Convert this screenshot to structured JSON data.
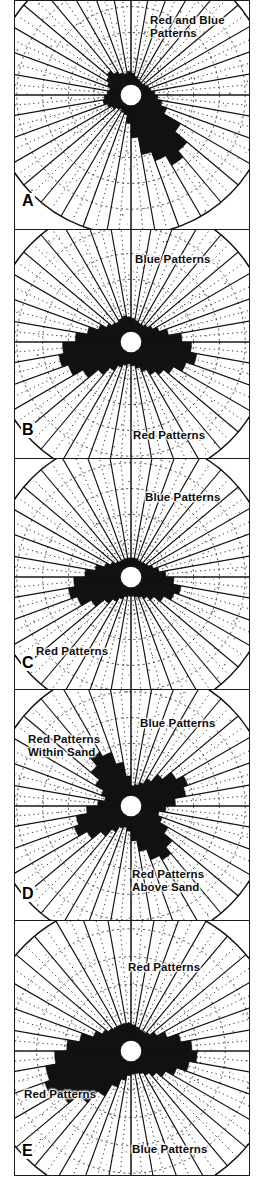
{
  "figure": {
    "kind": "rose-diagram-figure",
    "panel_count": 5,
    "ink_color": "#111111",
    "fill_color": "#111111",
    "background_color": "#ffffff"
  },
  "chart_data": [
    {
      "type": "rose",
      "panel": "A",
      "title": "Red and Blue\nPatterns",
      "labels": [
        {
          "text": "Red and Blue",
          "x": 150,
          "y": 14
        },
        {
          "text": "Patterns",
          "x": 150,
          "y": 27
        }
      ],
      "bins": 36,
      "bin_width_deg": 10,
      "start_angle_deg": 0,
      "grid_rings": 5,
      "rmax": 100,
      "values": [
        14,
        10,
        8,
        7,
        6,
        8,
        10,
        12,
        16,
        20,
        26,
        34,
        58,
        78,
        88,
        74,
        62,
        40,
        22,
        12,
        10,
        8,
        10,
        14,
        18,
        22,
        20,
        16,
        14,
        18,
        22,
        26,
        20,
        16,
        14,
        16
      ]
    },
    {
      "type": "rose",
      "panel": "B",
      "labels": [
        {
          "text": "Blue Patterns",
          "x": 135,
          "y": 253
        },
        {
          "text": "Red Patterns",
          "x": 133,
          "y": 429
        }
      ],
      "bins": 36,
      "bin_width_deg": 10,
      "start_angle_deg": 0,
      "grid_rings": 5,
      "rmax": 100,
      "values": [
        16,
        14,
        12,
        12,
        14,
        18,
        24,
        34,
        50,
        62,
        70,
        60,
        48,
        40,
        34,
        26,
        20,
        16,
        14,
        16,
        20,
        28,
        40,
        56,
        70,
        78,
        72,
        56,
        42,
        30,
        22,
        18,
        16,
        18,
        20,
        18
      ]
    },
    {
      "type": "rose",
      "panel": "C",
      "labels": [
        {
          "text": "Blue Patterns",
          "x": 145,
          "y": 491
        },
        {
          "text": "Red Patterns",
          "x": 36,
          "y": 645
        }
      ],
      "bins": 36,
      "bin_width_deg": 10,
      "start_angle_deg": 0,
      "grid_rings": 5,
      "rmax": 100,
      "values": [
        10,
        10,
        9,
        9,
        10,
        12,
        16,
        22,
        30,
        40,
        50,
        44,
        34,
        24,
        18,
        14,
        12,
        10,
        10,
        12,
        16,
        22,
        30,
        44,
        58,
        66,
        58,
        44,
        32,
        22,
        16,
        12,
        10,
        10,
        10,
        10
      ]
    },
    {
      "type": "rose",
      "panel": "D",
      "labels": [
        {
          "text": "Blue Patterns",
          "x": 140,
          "y": 717
        },
        {
          "text": "Red Patterns",
          "x": 28,
          "y": 733
        },
        {
          "text": "Within Sand",
          "x": 28,
          "y": 746
        },
        {
          "text": "Red Patterns",
          "x": 132,
          "y": 868
        },
        {
          "text": "Above Sand",
          "x": 132,
          "y": 881
        }
      ],
      "bins": 36,
      "bin_width_deg": 10,
      "start_angle_deg": 0,
      "grid_rings": 5,
      "rmax": 100,
      "values": [
        12,
        14,
        18,
        26,
        38,
        52,
        62,
        56,
        42,
        30,
        22,
        28,
        40,
        54,
        64,
        58,
        44,
        30,
        18,
        14,
        16,
        24,
        36,
        50,
        62,
        56,
        42,
        28,
        20,
        26,
        38,
        52,
        64,
        58,
        42,
        24
      ]
    },
    {
      "type": "rose",
      "panel": "E",
      "labels": [
        {
          "text": "Red Patterns",
          "x": 128,
          "y": 961
        },
        {
          "text": "Red Patterns",
          "x": 24,
          "y": 1088
        },
        {
          "text": "Blue Patterns",
          "x": 132,
          "y": 1143
        }
      ],
      "bins": 36,
      "bin_width_deg": 10,
      "start_angle_deg": 0,
      "grid_rings": 5,
      "rmax": 100,
      "values": [
        18,
        16,
        14,
        14,
        16,
        22,
        32,
        46,
        58,
        64,
        56,
        44,
        34,
        26,
        20,
        16,
        14,
        14,
        16,
        22,
        32,
        48,
        66,
        82,
        94,
        88,
        76,
        62,
        48,
        34,
        26,
        22,
        20,
        20,
        20,
        20
      ]
    }
  ],
  "panels": [
    {
      "letter": "A",
      "label_x": 6,
      "label_y": 192
    },
    {
      "letter": "B",
      "label_x": 6,
      "label_y": 192
    },
    {
      "letter": "C",
      "label_x": 6,
      "label_y": 196
    },
    {
      "letter": "D",
      "label_x": 6,
      "label_y": 196
    },
    {
      "letter": "E",
      "label_x": 6,
      "label_y": 222
    }
  ],
  "panel_geometry": [
    {
      "top": 0,
      "height": 230,
      "cx": 116,
      "cy": 94,
      "r": 140
    },
    {
      "top": 229,
      "height": 230,
      "cx": 116,
      "cy": 112,
      "r": 140
    },
    {
      "top": 458,
      "height": 232,
      "cx": 116,
      "cy": 118,
      "r": 140
    },
    {
      "top": 689,
      "height": 232,
      "cx": 116,
      "cy": 116,
      "r": 140
    },
    {
      "top": 920,
      "height": 256,
      "cx": 116,
      "cy": 130,
      "r": 150
    }
  ]
}
